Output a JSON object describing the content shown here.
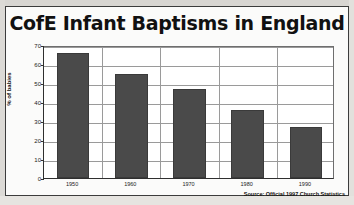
{
  "figure": {
    "source_note": "Source: Official 1997 Church Statistics"
  },
  "colors": {
    "bar_fill": "#4a4a4a",
    "plot_background": "#ffffff",
    "gridline": "#9a9a9a",
    "axis": "#2f2f2f",
    "text": "#111111"
  },
  "chart_data": {
    "type": "bar",
    "title": "CofE Infant Baptisms in England",
    "xlabel": "",
    "ylabel": "% of babies",
    "categories": [
      "1950",
      "1960",
      "1970",
      "1980",
      "1990"
    ],
    "values": [
      66,
      55,
      47,
      36,
      27
    ],
    "ylim": [
      0,
      70
    ],
    "yticks": [
      0,
      10,
      20,
      30,
      40,
      50,
      60,
      70
    ],
    "ytick_labels": [
      "0",
      "10",
      "20",
      "30",
      "40",
      "50",
      "60",
      "70"
    ],
    "grid": "horizontal-and-category-separators",
    "legend": "none",
    "annotations": [
      "Source: Official 1997 Church Statistics"
    ]
  }
}
